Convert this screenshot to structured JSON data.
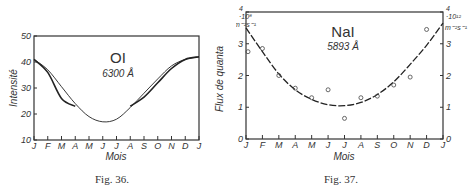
{
  "figures": [
    {
      "id": "fig36",
      "caption": "Fig. 36.",
      "title": "OI",
      "subtitle": "6300 Å",
      "xlabel": "Mois",
      "ylabel": "Intensité",
      "months": [
        "J",
        "F",
        "M",
        "A",
        "M",
        "J",
        "J",
        "A",
        "S",
        "O",
        "N",
        "D",
        "J"
      ],
      "yticks": [
        "10",
        "20",
        "30",
        "40",
        "50"
      ]
    },
    {
      "id": "fig37",
      "caption": "Fig. 37.",
      "title": "NaI",
      "subtitle": "5893 Å",
      "xlabel": "Mois",
      "ylabel": "Flux de quanta",
      "left_unit_exp": "·10⁸",
      "left_unit": "m⁻²s⁻¹",
      "right_unit_exp": "·10¹²",
      "right_unit": "m⁻²s⁻¹",
      "months": [
        "J",
        "F",
        "M",
        "A",
        "M",
        "J",
        "J",
        "A",
        "S",
        "O",
        "N",
        "D",
        "J"
      ],
      "yticks_left": [
        "0",
        "1",
        "2",
        "3",
        "4"
      ],
      "yticks_right": [
        "0",
        "1",
        "2",
        "3",
        "4"
      ]
    }
  ],
  "chart_data": [
    {
      "type": "line",
      "title": "OI 6300 Å",
      "xlabel": "Mois",
      "ylabel": "Intensité",
      "ylim": [
        10,
        50
      ],
      "categories": [
        "J",
        "F",
        "M",
        "A",
        "M",
        "J",
        "J",
        "A",
        "S",
        "O",
        "N",
        "D",
        "J"
      ],
      "series": [
        {
          "name": "fit (thin sinusoid)",
          "values": [
            41,
            37,
            30.5,
            24,
            19,
            17,
            18,
            22.5,
            28,
            33.5,
            38.5,
            41,
            42
          ]
        },
        {
          "name": "observed (thick), Jan–Apr",
          "values": [
            41,
            36,
            26,
            23,
            null,
            null,
            null,
            null,
            null,
            null,
            null,
            null,
            null
          ]
        },
        {
          "name": "observed (thick), Aug–Jan",
          "values": [
            null,
            null,
            null,
            null,
            null,
            null,
            null,
            23,
            26.5,
            32,
            37.5,
            41,
            42
          ]
        }
      ],
      "grid": false
    },
    {
      "type": "scatter",
      "title": "NaI 5893 Å",
      "xlabel": "Mois",
      "ylabel": "Flux de quanta (·10⁸ m⁻²s⁻¹ left, ·10¹² m⁻²s⁻¹ right)",
      "ylim": [
        0,
        4
      ],
      "categories": [
        "J",
        "F",
        "M",
        "A",
        "M",
        "J",
        "J",
        "A",
        "S",
        "O",
        "N",
        "D",
        "J"
      ],
      "series": [
        {
          "name": "observations",
          "values": [
            2.75,
            2.85,
            2.0,
            1.6,
            1.3,
            1.55,
            0.65,
            1.3,
            1.35,
            1.7,
            1.95,
            3.45,
            null
          ]
        },
        {
          "name": "fit (dashed)",
          "values": [
            3.5,
            2.75,
            2.05,
            1.55,
            1.25,
            1.08,
            1.05,
            1.15,
            1.4,
            1.8,
            2.35,
            2.95,
            3.65
          ]
        }
      ],
      "grid": false
    }
  ]
}
